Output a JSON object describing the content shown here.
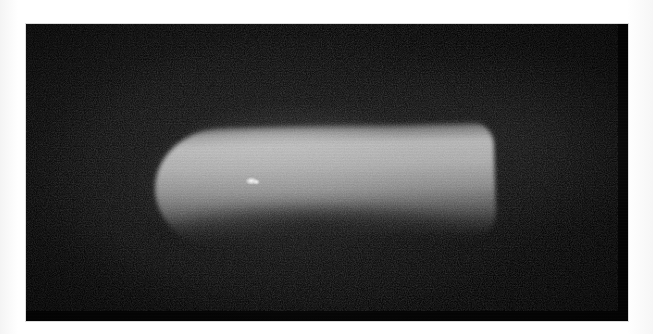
{
  "document": {
    "type": "photograph",
    "rendering": "grayscale",
    "width_px": 653,
    "height_px": 334,
    "background_color": "#ffffff"
  },
  "photo": {
    "name": "grayscale-photograph",
    "alt_text": "Low-light grayscale photograph of a bright capsule-shaped object on a black background",
    "frame": {
      "left_px": 26,
      "top_px": 24,
      "width_px": 602,
      "height_px": 297,
      "border_color": "#dcdcdc",
      "field_color": "#050505"
    },
    "characteristics": {
      "grain": "heavy film grain / sensor noise",
      "vignette": "true",
      "scan_banding": "faint horizontal banding"
    }
  },
  "subject": {
    "name": "capsule-object",
    "description": "Elongated bright capsule / pill shaped object, rounded left end, blunt right end",
    "bounds_px": {
      "left": 155,
      "top": 125,
      "width": 340,
      "height": 120
    },
    "tilt_degrees": -1.6,
    "colors": {
      "highlight": "#e8e8e8",
      "body_upper": "#c6c6c6",
      "body_mid": "#969696",
      "body_lower": "#484848",
      "shadow": "#080808"
    },
    "specular_highlight": {
      "name": "specular-highlight",
      "center_px": {
        "x": 252,
        "y": 181
      },
      "color": "#ffffff"
    }
  },
  "caption": ""
}
